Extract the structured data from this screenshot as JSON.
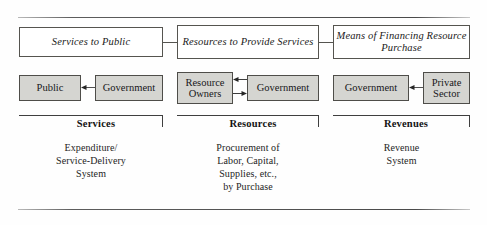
{
  "diagram": {
    "concept_row": [
      {
        "id": "services-to-public",
        "label": "Services to Public"
      },
      {
        "id": "resources-to-provide-services",
        "line1": "Resources to",
        "line2": "Provide Services"
      },
      {
        "id": "means-of-financing",
        "line1": "Means of Financing",
        "line2": "Resource Purchase"
      }
    ],
    "actor_row": [
      {
        "id": "public",
        "label": "Public"
      },
      {
        "id": "government-1",
        "label": "Government"
      },
      {
        "id": "resource-owners",
        "line1": "Resource",
        "line2": "Owners"
      },
      {
        "id": "government-2",
        "label": "Government"
      },
      {
        "id": "government-3",
        "label": "Government"
      },
      {
        "id": "private-sector",
        "line1": "Private",
        "line2": "Sector"
      }
    ],
    "arrows": [
      {
        "id": "government-to-public",
        "direction": "left"
      },
      {
        "id": "government-to-resource-owners",
        "direction": "left"
      },
      {
        "id": "resource-owners-to-government",
        "direction": "right"
      },
      {
        "id": "private-sector-to-government",
        "direction": "left"
      }
    ],
    "groups": [
      {
        "id": "services",
        "heading": "Services",
        "caption": [
          "Expenditure/",
          "Service-Delivery",
          "System"
        ]
      },
      {
        "id": "resources",
        "heading": "Resources",
        "caption": [
          "Procurement of",
          "Labor, Capital,",
          "Supplies, etc.,",
          "by Purchase"
        ]
      },
      {
        "id": "revenues",
        "heading": "Revenues",
        "caption": [
          "Revenue",
          "System"
        ]
      }
    ],
    "colors": {
      "actor_box_fill": "#d5d5d1",
      "concept_box_fill": "#ffffff",
      "border": "#4e4d49",
      "rule": "#4a4a4a",
      "text": "#1a1a1a"
    }
  }
}
